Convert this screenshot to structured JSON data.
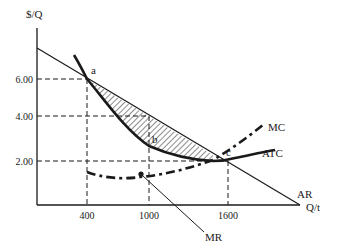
{
  "axes": {
    "y_label": "$/Q",
    "x_label": "Q/t",
    "y_ticks": [
      {
        "label": "6.00",
        "value": 6.0
      },
      {
        "label": "4.00",
        "value": 4.0
      },
      {
        "label": "2.00",
        "value": 2.0
      }
    ],
    "x_ticks": [
      {
        "label": "400",
        "value": 400
      },
      {
        "label": "1000",
        "value": 1000
      },
      {
        "label": "1600",
        "value": 1600
      }
    ]
  },
  "curves": {
    "ar": {
      "label": "AR"
    },
    "mr": {
      "label": "MR"
    },
    "mc": {
      "label": "MC"
    },
    "atc": {
      "label": "ATC"
    }
  },
  "points": {
    "a": {
      "label": "a",
      "q": 400,
      "p": 6.0
    },
    "b": {
      "label": "b",
      "q": 1000,
      "p": 3.0
    },
    "c": {
      "label": "c",
      "q": 1600,
      "p": 2.0
    }
  },
  "colors": {
    "ink": "#1a1a1a",
    "background": "#ffffff"
  }
}
